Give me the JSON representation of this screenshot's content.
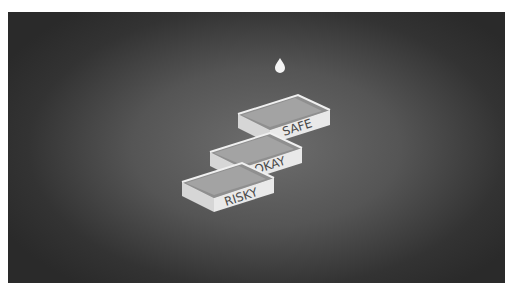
{
  "illustration": {
    "description": "Three stacked isometric trays with a water drop above",
    "drop_icon": "water-drop-icon",
    "trays": [
      {
        "label": "SAFE"
      },
      {
        "label": "OKAY"
      },
      {
        "label": "RISKY"
      }
    ]
  },
  "colors": {
    "background_center": "#6e6e6e",
    "background_edge": "#2a2a2a",
    "tray_front": "#e6e6e6",
    "tray_side": "#cfcfcf",
    "tray_inner": "#9a9a9a",
    "label_text": "#4a4a4a"
  }
}
